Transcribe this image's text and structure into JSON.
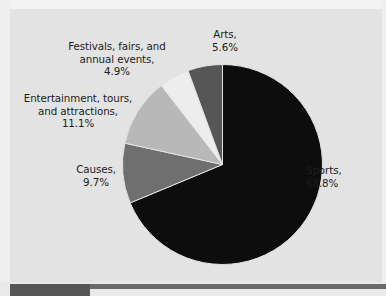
{
  "chart_data": {
    "type": "pie",
    "title": "",
    "subtitle": "",
    "xlabel": "",
    "ylabel": "",
    "legend_position": "none",
    "grid": false,
    "units": "percent",
    "total": 100.1,
    "start_angle_deg": 0,
    "direction": "clockwise",
    "categories": [
      "Sports",
      "Causes",
      "Entertainment, tours, and attractions",
      "Festivals, fairs, and annual events",
      "Arts"
    ],
    "values": [
      68.8,
      9.7,
      11.1,
      4.9,
      5.6
    ],
    "colors": [
      "#0d0d0d",
      "#6f6f6f",
      "#b8b8b8",
      "#ededed",
      "#565656"
    ],
    "slices": [
      {
        "name": "Sports",
        "value": 68.8,
        "value_label": "68.8%",
        "color": "#0d0d0d",
        "angle_deg": 247.7,
        "start_deg": 0,
        "end_deg": 247.7
      },
      {
        "name": "Causes",
        "value": 9.7,
        "value_label": "9.7%",
        "color": "#6f6f6f",
        "angle_deg": 34.9,
        "start_deg": 247.7,
        "end_deg": 282.6
      },
      {
        "name": "Entertainment, tours, and attractions",
        "value": 11.1,
        "value_label": "11.1%",
        "color": "#b8b8b8",
        "angle_deg": 39.9,
        "start_deg": 282.6,
        "end_deg": 322.5
      },
      {
        "name": "Festivals, fairs, and annual events",
        "value": 4.9,
        "value_label": "4.9%",
        "color": "#ededed",
        "angle_deg": 17.6,
        "start_deg": 322.5,
        "end_deg": 340.1
      },
      {
        "name": "Arts",
        "value": 5.6,
        "value_label": "5.6%",
        "color": "#565656",
        "angle_deg": 20.2,
        "start_deg": 340.1,
        "end_deg": 360.3
      }
    ]
  },
  "labels": {
    "arts": "Arts,\n5.6%",
    "festivals": "Festivals, fairs, and\nannual events,\n4.9%",
    "entertainment": "Entertainment, tours,\nand attractions,\n11.1%",
    "causes": "Causes,\n9.7%",
    "sports": "Sports,\n68.8%"
  },
  "style": {
    "background": "#e3e3e3",
    "text_color": "#1c1c1c",
    "slice_outline": "#e3e3e3",
    "rule_color": "#6a6a6a",
    "tab_color": "#565656"
  }
}
